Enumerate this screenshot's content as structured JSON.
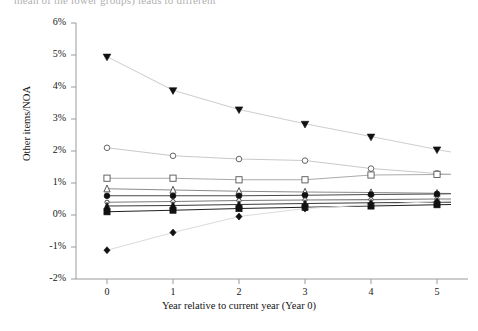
{
  "figure": {
    "cut_header_text": "mean of the lower groups) leads to different",
    "axes": {
      "ylabel": "Other items/NOA",
      "xlabel": "Year relative to current year (Year 0)",
      "yticks": [
        "6%",
        "5%",
        "4%",
        "3%",
        "2%",
        "1%",
        "0%",
        "-1%",
        "-2%"
      ],
      "xticks": [
        "0",
        "1",
        "2",
        "3",
        "4",
        "5"
      ]
    }
  },
  "chart_data": {
    "type": "line",
    "title": "",
    "subtitle": "",
    "xlabel": "Year relative to current year (Year 0)",
    "ylabel": "Other items/NOA",
    "x": [
      0,
      1,
      2,
      3,
      4,
      5
    ],
    "xlim": [
      -0.15,
      5.35
    ],
    "ylim": [
      -2,
      6
    ],
    "yunit": "percent",
    "ytick_values": [
      6,
      5,
      4,
      3,
      2,
      1,
      0,
      -1,
      -2
    ],
    "ytick_labels": [
      "6%",
      "5%",
      "4%",
      "3%",
      "2%",
      "1%",
      "0%",
      "-1%",
      "-2%"
    ],
    "xtick_values": [
      0,
      1,
      2,
      3,
      4,
      5
    ],
    "xtick_labels": [
      "0",
      "1",
      "2",
      "3",
      "4",
      "5"
    ],
    "grid": false,
    "legend": "none",
    "legend_position": "none",
    "series": [
      {
        "name": "series-1",
        "marker": "triangle-down-filled",
        "color": "#111111",
        "line_color": "#cfcfcf",
        "values": [
          4.95,
          3.9,
          3.3,
          2.85,
          2.45,
          2.05
        ]
      },
      {
        "name": "series-2",
        "marker": "circle-open",
        "color": "#555555",
        "line_color": "#c9c9c9",
        "values": [
          2.1,
          1.85,
          1.75,
          1.7,
          1.45,
          1.3
        ]
      },
      {
        "name": "series-3",
        "marker": "square-open",
        "color": "#555555",
        "line_color": "#aaaaaa",
        "values": [
          1.15,
          1.15,
          1.1,
          1.1,
          1.25,
          1.27
        ]
      },
      {
        "name": "series-4",
        "marker": "triangle-up-open",
        "color": "#444444",
        "line_color": "#8c8c8c",
        "values": [
          0.82,
          0.78,
          0.74,
          0.72,
          0.7,
          0.68
        ]
      },
      {
        "name": "series-5",
        "marker": "circle-filled",
        "color": "#111111",
        "line_color": "#4a4a4a",
        "values": [
          0.6,
          0.6,
          0.6,
          0.62,
          0.64,
          0.66
        ]
      },
      {
        "name": "series-6",
        "marker": "circle-open-small",
        "color": "#333333",
        "line_color": "#7a7a7a",
        "values": [
          0.4,
          0.42,
          0.45,
          0.47,
          0.48,
          0.5
        ]
      },
      {
        "name": "series-7",
        "marker": "triangle-up-filled",
        "color": "#111111",
        "line_color": "#3a3a3a",
        "values": [
          0.28,
          0.3,
          0.33,
          0.36,
          0.38,
          0.4
        ]
      },
      {
        "name": "series-8",
        "marker": "square-filled",
        "color": "#111111",
        "line_color": "#222222",
        "values": [
          0.1,
          0.15,
          0.2,
          0.24,
          0.28,
          0.32
        ]
      },
      {
        "name": "series-9",
        "marker": "diamond-filled",
        "color": "#111111",
        "line_color": "#dcdcdc",
        "values": [
          -1.1,
          -0.55,
          -0.05,
          0.2,
          0.32,
          0.42
        ]
      }
    ]
  }
}
